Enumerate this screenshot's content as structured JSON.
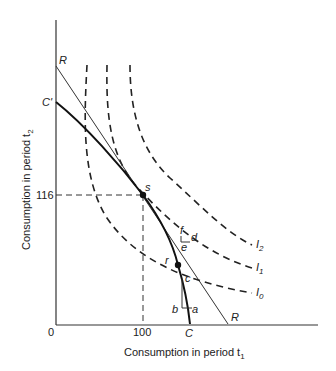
{
  "diagram": {
    "type": "intertemporal-consumption",
    "axes": {
      "xlabel": "Consumption in period t",
      "xlabel_sub": "1",
      "ylabel": "Consumption in period t",
      "ylabel_sub": "2",
      "origin_label": "0",
      "x_tick_label": "100",
      "y_tick_label": "116"
    },
    "lines": {
      "budget_line_label_top": "R",
      "budget_line_label_bottom": "R",
      "production_curve_label_top": "C'",
      "production_curve_label_bottom": "C"
    },
    "indifference_curves": [
      {
        "label": "I",
        "sub": "0"
      },
      {
        "label": "I",
        "sub": "1"
      },
      {
        "label": "I",
        "sub": "2"
      }
    ],
    "points": {
      "s": "s",
      "r": "r",
      "c": "c",
      "a": "a",
      "b": "b",
      "d": "d",
      "e": "e",
      "f": "f"
    },
    "colors": {
      "ink": "#222222",
      "background": "#ffffff"
    }
  }
}
